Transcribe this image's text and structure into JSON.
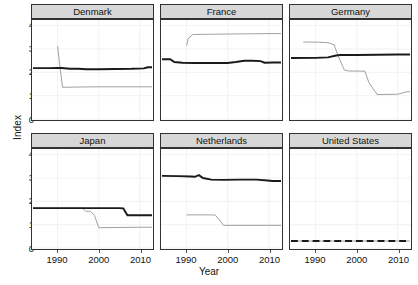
{
  "chart_data": {
    "type": "line",
    "title": "",
    "xlabel": "Year",
    "ylabel": "Index",
    "xlim": [
      1984,
      2013
    ],
    "ylim": [
      0,
      4.2
    ],
    "xticks": [
      1990,
      2000,
      2010
    ],
    "yticks": [
      0,
      1,
      2,
      3,
      4
    ],
    "grid": true,
    "legend": "none",
    "facet_layout": {
      "rows": 2,
      "cols": 3
    },
    "series_styles": [
      {
        "name": "black-series",
        "color": "#1a1a1a",
        "width": 2.0
      },
      {
        "name": "gray-series",
        "color": "#9e9e9e",
        "width": 1.0
      }
    ],
    "panels": [
      {
        "facet": "Denmark",
        "series": [
          {
            "name": "black-series",
            "x": [
              1984,
              1988,
              1990,
              1991,
              1993,
              1995,
              1997,
              2000,
              2004,
              2008,
              2011,
              2012,
              2013
            ],
            "y": [
              2.18,
              2.18,
              2.19,
              2.19,
              2.15,
              2.15,
              2.13,
              2.13,
              2.14,
              2.15,
              2.17,
              2.22,
              2.22
            ]
          },
          {
            "name": "gray-series",
            "x": [
              1990,
              1990.6,
              1991.2,
              1995,
              2000,
              2005,
              2010,
              2013
            ],
            "y": [
              3.12,
              2.2,
              1.36,
              1.37,
              1.38,
              1.38,
              1.38,
              1.38
            ]
          }
        ]
      },
      {
        "facet": "France",
        "series": [
          {
            "name": "black-series",
            "x": [
              1984,
              1986,
              1987,
              1989,
              1992,
              1996,
              2000,
              2002,
              2004,
              2006,
              2008,
              2009,
              2011,
              2013
            ],
            "y": [
              2.56,
              2.56,
              2.44,
              2.41,
              2.4,
              2.4,
              2.4,
              2.44,
              2.5,
              2.5,
              2.48,
              2.41,
              2.42,
              2.42
            ]
          },
          {
            "name": "gray-series",
            "x": [
              1990,
              1990.4,
              1991.5,
              1995,
              2000,
              2005,
              2010,
              2013
            ],
            "y": [
              3.14,
              3.45,
              3.62,
              3.63,
              3.64,
              3.65,
              3.66,
              3.66
            ]
          }
        ]
      },
      {
        "facet": "Germany",
        "series": [
          {
            "name": "black-series",
            "x": [
              1984,
              1990,
              1993,
              1995,
              1996,
              2000,
              2005,
              2010,
              2013
            ],
            "y": [
              2.61,
              2.62,
              2.64,
              2.72,
              2.74,
              2.74,
              2.75,
              2.76,
              2.76
            ]
          },
          {
            "name": "gray-series",
            "x": [
              1987,
              1991,
              1993,
              1994.5,
              1995.5,
              1997,
              1998,
              2002,
              2003,
              2005,
              2010,
              2012,
              2013
            ],
            "y": [
              3.3,
              3.29,
              3.27,
              3.18,
              2.7,
              2.1,
              2.06,
              2.05,
              1.55,
              1.05,
              1.06,
              1.16,
              1.17
            ]
          }
        ]
      },
      {
        "facet": "Japan",
        "series": [
          {
            "name": "black-series",
            "x": [
              1984,
              1990,
              1996,
              2000,
              2005,
              2006,
              2007,
              2010,
              2013
            ],
            "y": [
              1.71,
              1.71,
              1.71,
              1.71,
              1.71,
              1.7,
              1.4,
              1.4,
              1.4
            ]
          },
          {
            "name": "gray-series",
            "x": [
              1984,
              1990,
              1996,
              1996.8,
              1998,
              1999,
              2000,
              2005,
              2010,
              2013
            ],
            "y": [
              1.71,
              1.71,
              1.71,
              1.58,
              1.57,
              1.4,
              0.87,
              0.88,
              0.89,
              0.89
            ]
          }
        ]
      },
      {
        "facet": "Netherlands",
        "series": [
          {
            "name": "black-series",
            "x": [
              1984,
              1988,
              1991,
              1992,
              1993,
              1994,
              1996,
              1999,
              2003,
              2007,
              2009,
              2011,
              2013
            ],
            "y": [
              3.09,
              3.08,
              3.06,
              3.05,
              3.12,
              3.0,
              2.93,
              2.92,
              2.93,
              2.93,
              2.9,
              2.87,
              2.87
            ]
          },
          {
            "name": "gray-series",
            "x": [
              1990,
              1993,
              1996,
              1997,
              1998,
              1999,
              2004,
              2010,
              2013
            ],
            "y": [
              1.42,
              1.42,
              1.42,
              1.41,
              1.2,
              0.97,
              0.97,
              0.97,
              0.97
            ]
          }
        ]
      },
      {
        "facet": "United States",
        "series": [
          {
            "name": "black-series",
            "x": [
              1984,
              1990,
              1995,
              2000,
              2005,
              2010,
              2013
            ],
            "y": [
              0.3,
              0.3,
              0.3,
              0.3,
              0.3,
              0.3,
              0.3
            ],
            "dash": "7,4"
          },
          {
            "name": "gray-series",
            "x": [
              1984,
              1990,
              1995,
              2000,
              2005,
              2010,
              2013
            ],
            "y": [
              0.3,
              0.3,
              0.3,
              0.3,
              0.3,
              0.3,
              0.3
            ]
          }
        ]
      }
    ]
  },
  "axes": {
    "y_title": "Index",
    "x_title": "Year",
    "y_tick_labels": [
      "0",
      "1",
      "2",
      "3",
      "4"
    ],
    "x_tick_labels": [
      "1990",
      "2000",
      "2010"
    ]
  },
  "facets": {
    "labels": [
      "Denmark",
      "France",
      "Germany",
      "Japan",
      "Netherlands",
      "United States"
    ]
  },
  "colors": {
    "black_line": "#1a1a1a",
    "gray_line": "#9e9e9e",
    "strip_fill": "#d7d7d7",
    "panel_border": "#323232",
    "grid": "#eeeeee",
    "text": "#121212"
  }
}
